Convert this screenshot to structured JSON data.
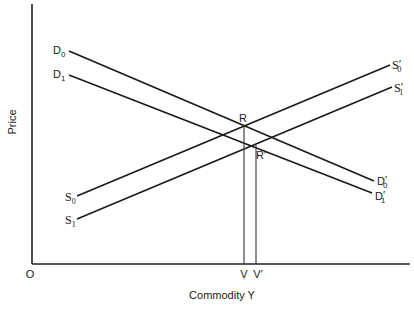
{
  "diagram": {
    "axes": {
      "y_label": "Price",
      "x_label": "Commodity Y",
      "origin_label": "O"
    },
    "curves": [
      {
        "id": "D0",
        "type": "demand",
        "start_label": {
          "base": "D",
          "sub": "0",
          "prime": ""
        },
        "end_label": {
          "base": "D",
          "sub": "0",
          "prime": "′"
        }
      },
      {
        "id": "D1",
        "type": "demand",
        "start_label": {
          "base": "D",
          "sub": "1",
          "prime": ""
        },
        "end_label": {
          "base": "D",
          "sub": "1",
          "prime": "′"
        }
      },
      {
        "id": "S0",
        "type": "supply",
        "start_label": {
          "base": "S",
          "sub": "0",
          "prime": ""
        },
        "end_label": {
          "base": "S",
          "sub": "0",
          "prime": "′"
        }
      },
      {
        "id": "S1",
        "type": "supply",
        "start_label": {
          "base": "S",
          "sub": "1",
          "prime": ""
        },
        "end_label": {
          "base": "S",
          "sub": "1",
          "prime": "′"
        }
      }
    ],
    "points": [
      {
        "id": "R",
        "label": "R"
      },
      {
        "id": "R_prime",
        "label": "R′"
      }
    ],
    "x_ticks": [
      {
        "id": "V",
        "label": "V"
      },
      {
        "id": "V_prime",
        "label": "V′"
      }
    ]
  }
}
